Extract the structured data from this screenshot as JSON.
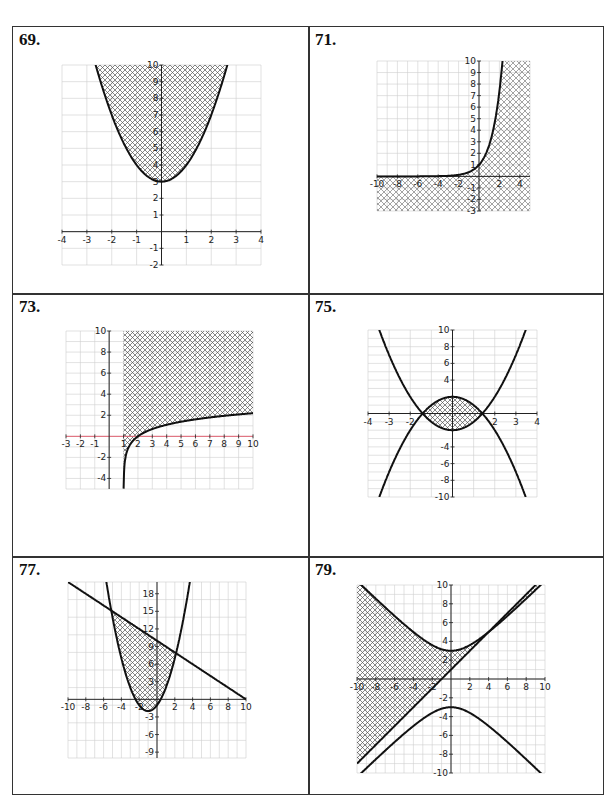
{
  "page": {
    "header_mark": "·"
  },
  "chart_data": [
    {
      "id": "p69",
      "problem_label": "69.",
      "type": "line",
      "title": "",
      "xlabel": "",
      "ylabel": "",
      "xlim": [
        -4,
        4
      ],
      "ylim": [
        -2,
        10
      ],
      "grid": true,
      "x_ticks": [
        -4,
        -3,
        -2,
        -1,
        1,
        2,
        3,
        4
      ],
      "y_ticks": [
        -2,
        -1,
        1,
        2,
        3,
        4,
        5,
        6,
        7,
        8,
        9,
        10
      ],
      "curves": [
        {
          "name": "y = x^2 + 3",
          "fn": "x*x+3",
          "x_range": [
            -4,
            4
          ]
        }
      ],
      "shaded_region": "y >= x^2 + 3",
      "shading": "crosshatch"
    },
    {
      "id": "p71",
      "problem_label": "71.",
      "type": "line",
      "title": "",
      "xlabel": "",
      "ylabel": "",
      "xlim": [
        -10,
        5
      ],
      "ylim": [
        -3,
        10
      ],
      "grid": true,
      "x_ticks": [
        -10,
        -8,
        -6,
        -4,
        -2,
        2,
        4
      ],
      "y_ticks": [
        -3,
        -2,
        -1,
        1,
        2,
        3,
        4,
        5,
        6,
        7,
        8,
        9,
        10
      ],
      "curves": [
        {
          "name": "y = e^x",
          "fn": "Math.exp(x)",
          "x_range": [
            -10,
            5
          ]
        }
      ],
      "shaded_region": "y <= e^x",
      "shading": "diagonal-hatch"
    },
    {
      "id": "p73",
      "problem_label": "73.",
      "type": "line",
      "title": "",
      "xlabel": "",
      "ylabel": "",
      "xlim": [
        -3,
        10
      ],
      "ylim": [
        -5,
        10
      ],
      "grid": true,
      "x_ticks": [
        -3,
        -2,
        -1,
        1,
        2,
        3,
        4,
        5,
        6,
        7,
        8,
        9,
        10
      ],
      "y_ticks": [
        -4,
        -2,
        2,
        4,
        6,
        8,
        10
      ],
      "curves": [
        {
          "name": "y = ln(x - 1)",
          "fn": "Math.log(x-1)",
          "x_range": [
            1.007,
            10
          ]
        }
      ],
      "shaded_region": "y >= ln(x - 1), x > 1",
      "shading": "crosshatch",
      "x_axis_color": "#e06070"
    },
    {
      "id": "p75",
      "problem_label": "75.",
      "type": "line",
      "title": "",
      "xlabel": "",
      "ylabel": "",
      "xlim": [
        -4,
        4
      ],
      "ylim": [
        -10,
        10
      ],
      "grid": true,
      "x_ticks": [
        -4,
        -3,
        -2,
        2,
        3,
        4
      ],
      "y_ticks": [
        -10,
        -8,
        -6,
        -4,
        4,
        6,
        8,
        10
      ],
      "curves": [
        {
          "name": "y = x^2 - 2",
          "fn": "x*x-2",
          "x_range": [
            -4,
            4
          ]
        },
        {
          "name": "y = 2 - x^2",
          "fn": "2-x*x",
          "x_range": [
            -4,
            4
          ]
        }
      ],
      "shaded_region": "x^2 - 2 <= y <= 2 - x^2",
      "shading": "crosshatch"
    },
    {
      "id": "p77",
      "problem_label": "77.",
      "type": "line",
      "title": "",
      "xlabel": "",
      "ylabel": "",
      "xlim": [
        -10,
        10
      ],
      "ylim": [
        -10,
        20
      ],
      "grid": true,
      "x_ticks": [
        -10,
        -8,
        -6,
        -4,
        -2,
        2,
        4,
        6,
        8,
        10
      ],
      "y_ticks": [
        -9,
        -6,
        -3,
        3,
        6,
        9,
        12,
        15,
        18
      ],
      "curves": [
        {
          "name": "y = x^2 + 2x - 1",
          "fn": "x*x+2*x-1",
          "x_range": [
            -10,
            10
          ]
        },
        {
          "name": "y = 10 - x",
          "fn": "10-x",
          "x_range": [
            -10,
            10
          ]
        }
      ],
      "shaded_region": "x^2 + 2x - 1 <= y <= 10 - x",
      "shading": "crosshatch"
    },
    {
      "id": "p79",
      "problem_label": "79.",
      "type": "line",
      "title": "",
      "xlabel": "",
      "ylabel": "",
      "xlim": [
        -10,
        10
      ],
      "ylim": [
        -10,
        10
      ],
      "grid": true,
      "x_ticks": [
        -10,
        -8,
        -6,
        -4,
        -2,
        2,
        4,
        6,
        8,
        10
      ],
      "y_ticks": [
        -10,
        -8,
        -6,
        -4,
        -2,
        2,
        4,
        6,
        8,
        10
      ],
      "curves": [
        {
          "name": "y = sqrt(x^2 + 9)",
          "fn": "Math.sqrt(x*x+9)",
          "x_range": [
            -10,
            10
          ]
        },
        {
          "name": "y = -sqrt(x^2 + 9)",
          "fn": "-Math.sqrt(x*x+9)",
          "x_range": [
            -10,
            10
          ]
        },
        {
          "name": "y = x + 1",
          "fn": "x+1",
          "x_range": [
            -10,
            10
          ]
        }
      ],
      "shaded_region": "x + 1 <= y <= sqrt(x^2 + 9)",
      "shading": "crosshatch"
    }
  ]
}
